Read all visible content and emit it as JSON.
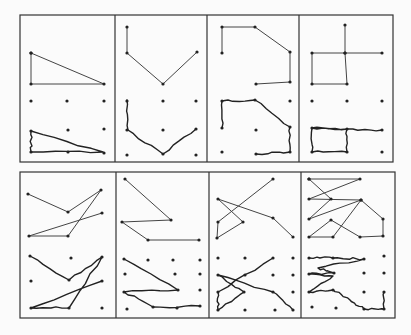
{
  "figure": {
    "colors": {
      "ink": "#222222",
      "background": "#fbfbfb"
    },
    "rows": [
      {
        "frame": {
          "x": 20,
          "y": 15,
          "w": 373,
          "h": 147
        },
        "dividers": [
          115,
          207,
          299
        ],
        "panels": [
          {
            "id": "top-1",
            "reference": [
              [
                31,
                53
              ],
              [
                104,
                84
              ],
              [
                31,
                84
              ],
              [
                31,
                53
              ]
            ],
            "drawn": [
              [
                31,
                131
              ],
              [
                103,
                152
              ],
              [
                31,
                152
              ],
              [
                31,
                131
              ]
            ],
            "dots": [
              [
                31,
                101
              ],
              [
                67,
                101
              ],
              [
                104,
                101
              ],
              [
                68,
                130
              ],
              [
                104,
                129
              ],
              [
                31,
                131
              ],
              [
                31,
                152
              ],
              [
                68,
                152
              ],
              [
                104,
                153
              ]
            ]
          },
          {
            "id": "top-2",
            "reference": [
              [
                127,
                27
              ],
              [
                127,
                53
              ],
              [
                163,
                84
              ],
              [
                197,
                52
              ]
            ],
            "drawn": [
              [
                127,
                100
              ],
              [
                128,
                130
              ],
              [
                163,
                154
              ],
              [
                196,
                129
              ]
            ],
            "dots": [
              [
                127,
                101
              ],
              [
                163,
                101
              ],
              [
                196,
                101
              ],
              [
                127,
                130
              ],
              [
                163,
                130
              ],
              [
                196,
                129
              ],
              [
                127,
                155
              ],
              [
                163,
                154
              ],
              [
                196,
                155
              ]
            ]
          },
          {
            "id": "top-3",
            "reference": [
              [
                222,
                53
              ],
              [
                222,
                27
              ],
              [
                255,
                27
              ],
              [
                290,
                52
              ],
              [
                290,
                82
              ],
              [
                256,
                84
              ]
            ],
            "drawn": [
              [
                222,
                128
              ],
              [
                222,
                101
              ],
              [
                255,
                100
              ],
              [
                290,
                127
              ],
              [
                290,
                152
              ],
              [
                256,
                154
              ]
            ],
            "dots": [
              [
                222,
                101
              ],
              [
                255,
                100
              ],
              [
                290,
                101
              ],
              [
                222,
                128
              ],
              [
                256,
                130
              ],
              [
                290,
                127
              ],
              [
                222,
                152
              ],
              [
                256,
                154
              ],
              [
                290,
                152
              ]
            ]
          },
          {
            "id": "top-4",
            "reference": [
              [
                345,
                25
              ],
              [
                345,
                53
              ],
              [
                312,
                53
              ],
              [
                312,
                84
              ],
              [
                347,
                84
              ],
              [
                345,
                53
              ],
              [
                382,
                53
              ]
            ],
            "drawn": [
              [
                312,
                128
              ],
              [
                312,
                152
              ],
              [
                347,
                152
              ],
              [
                347,
                129
              ],
              [
                312,
                128
              ],
              [
                347,
                129
              ],
              [
                382,
                130
              ]
            ],
            "dots": [
              [
                312,
                101
              ],
              [
                347,
                101
              ],
              [
                382,
                101
              ],
              [
                312,
                128
              ],
              [
                347,
                129
              ],
              [
                382,
                130
              ],
              [
                312,
                152
              ],
              [
                347,
                152
              ],
              [
                382,
                152
              ]
            ]
          }
        ]
      },
      {
        "frame": {
          "x": 20,
          "y": 172,
          "w": 375,
          "h": 146
        },
        "dividers": [
          116,
          209,
          301
        ],
        "panels": [
          {
            "id": "bottom-1",
            "reference": [
              [
                28,
                194
              ],
              [
                68,
                212
              ],
              [
                101,
                190
              ],
              [
                68,
                236
              ],
              [
                29,
                236
              ],
              [
                102,
                213
              ]
            ],
            "drawn": [
              [
                30,
                256
              ],
              [
                69,
                280
              ],
              [
                102,
                257
              ],
              [
                69,
                308
              ],
              [
                31,
                308
              ],
              [
                102,
                281
              ]
            ],
            "dots": [
              [
                30,
                256
              ],
              [
                71,
                258
              ],
              [
                102,
                257
              ],
              [
                31,
                281
              ],
              [
                69,
                280
              ],
              [
                102,
                281
              ],
              [
                31,
                308
              ],
              [
                69,
                308
              ],
              [
                102,
                308
              ]
            ]
          },
          {
            "id": "bottom-2",
            "reference": [
              [
                125,
                179
              ],
              [
                171,
                220
              ],
              [
                122,
                222
              ],
              [
                148,
                240
              ],
              [
                199,
                240
              ]
            ],
            "drawn": [
              [
                124,
                259
              ],
              [
                178,
                290
              ],
              [
                124,
                292
              ],
              [
                153,
                307
              ],
              [
                200,
                306
              ]
            ],
            "dots": [
              [
                124,
                259
              ],
              [
                148,
                260
              ],
              [
                173,
                260
              ],
              [
                200,
                260
              ],
              [
                125,
                274
              ],
              [
                175,
                274
              ],
              [
                200,
                274
              ],
              [
                124,
                292
              ],
              [
                178,
                290
              ],
              [
                200,
                290
              ],
              [
                127,
                309
              ],
              [
                153,
                307
              ],
              [
                177,
                308
              ],
              [
                200,
                306
              ]
            ]
          },
          {
            "id": "bottom-3",
            "reference": [
              [
                273,
                179
              ],
              [
                218,
                222
              ],
              [
                217,
                238
              ],
              [
                243,
                222
              ],
              [
                218,
                199
              ],
              [
                273,
                218
              ],
              [
                293,
                237
              ]
            ],
            "drawn": [
              [
                273,
                258
              ],
              [
                218,
                292
              ],
              [
                218,
                310
              ],
              [
                244,
                292
              ],
              [
                218,
                275
              ],
              [
                273,
                292
              ],
              [
                293,
                310
              ]
            ],
            "dots": [
              [
                218,
                258
              ],
              [
                245,
                258
              ],
              [
                273,
                258
              ],
              [
                293,
                258
              ],
              [
                218,
                275
              ],
              [
                245,
                275
              ],
              [
                273,
                275
              ],
              [
                293,
                275
              ],
              [
                218,
                292
              ],
              [
                244,
                292
              ],
              [
                273,
                292
              ],
              [
                293,
                292
              ],
              [
                218,
                310
              ],
              [
                245,
                310
              ],
              [
                275,
                310
              ],
              [
                293,
                310
              ]
            ]
          },
          {
            "id": "bottom-4",
            "reference": [
              [
                309,
                179
              ],
              [
                360,
                179
              ],
              [
                309,
                199
              ],
              [
                361,
                200
              ],
              [
                383,
                219
              ],
              [
                383,
                236
              ],
              [
                360,
                237
              ],
              [
                331,
                220
              ],
              [
                309,
                237
              ],
              [
                333,
                237
              ],
              [
                361,
                200
              ],
              [
                309,
                219
              ],
              [
                331,
                199
              ],
              [
                309,
                179
              ]
            ],
            "drawn": [
              [
                309,
                258
              ],
              [
                333,
                258
              ],
              [
                364,
                259
              ],
              [
                318,
                268
              ],
              [
                334,
                273
              ],
              [
                309,
                274
              ],
              [
                333,
                276
              ],
              [
                309,
                292
              ],
              [
                333,
                290
              ],
              [
                350,
                300
              ],
              [
                364,
                309
              ],
              [
                384,
                309
              ],
              [
                384,
                292
              ]
            ],
            "dots": [
              [
                309,
                258
              ],
              [
                333,
                258
              ],
              [
                364,
                259
              ],
              [
                384,
                256
              ],
              [
                309,
                274
              ],
              [
                334,
                273
              ],
              [
                364,
                273
              ],
              [
                384,
                273
              ],
              [
                309,
                292
              ],
              [
                333,
                290
              ],
              [
                364,
                292
              ],
              [
                384,
                292
              ],
              [
                312,
                307
              ],
              [
                336,
                308
              ],
              [
                364,
                309
              ],
              [
                384,
                309
              ]
            ]
          }
        ]
      }
    ]
  }
}
